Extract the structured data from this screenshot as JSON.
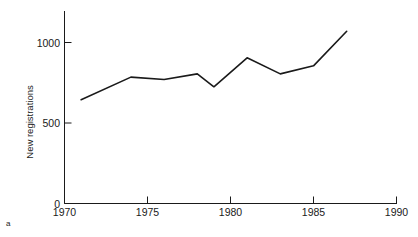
{
  "figure": {
    "panel_label": "a"
  },
  "chart_data": {
    "type": "line",
    "title": "",
    "xlabel": "",
    "ylabel": "New registrations",
    "xlim": [
      1970,
      1990
    ],
    "ylim": [
      0,
      1150
    ],
    "grid": false,
    "legend": null,
    "xticks": [
      1970,
      1975,
      1980,
      1985,
      1990
    ],
    "xtick_labels": [
      "1970",
      "1975",
      "1980",
      "1985",
      "1990"
    ],
    "yticks": [
      0,
      500,
      1000
    ],
    "ytick_labels": [
      "0",
      "500",
      "1000"
    ],
    "x": [
      1971,
      1974,
      1976,
      1978,
      1979,
      1981,
      1983,
      1985,
      1987
    ],
    "values": [
      645,
      785,
      770,
      805,
      725,
      905,
      805,
      855,
      1070
    ],
    "series": [
      {
        "name": "New registrations",
        "color": "#1a1a1a",
        "x": [
          1971,
          1974,
          1976,
          1978,
          1979,
          1981,
          1983,
          1985,
          1987
        ],
        "values": [
          645,
          785,
          770,
          805,
          725,
          905,
          805,
          855,
          1070
        ]
      }
    ]
  }
}
